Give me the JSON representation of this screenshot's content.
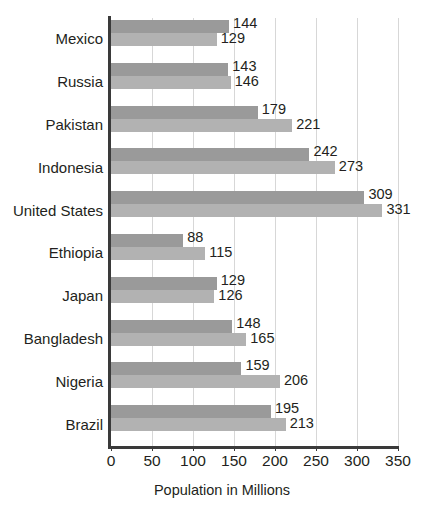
{
  "chart_data": {
    "type": "bar",
    "orientation": "horizontal",
    "title": "",
    "xlabel": "Population in Millions",
    "ylabel": "",
    "xlim": [
      0,
      350
    ],
    "xticks": [
      0,
      50,
      100,
      150,
      200,
      250,
      300,
      350
    ],
    "xtick_labels": [
      "0",
      "50",
      "100",
      "150",
      "200",
      "250",
      "300",
      "350"
    ],
    "grid": "vertical",
    "legend": "none",
    "categories": [
      "Mexico",
      "Russia",
      "Pakistan",
      "Indonesia",
      "United States",
      "Ethiopia",
      "Japan",
      "Bangladesh",
      "Nigeria",
      "Brazil"
    ],
    "series": [
      {
        "name": "series-1",
        "color": "#9a9a9a",
        "values": [
          144,
          143,
          179,
          242,
          309,
          88,
          129,
          148,
          159,
          195
        ]
      },
      {
        "name": "series-2",
        "color": "#b2b2b2",
        "values": [
          129,
          146,
          221,
          273,
          331,
          115,
          126,
          165,
          206,
          213
        ]
      }
    ],
    "data_labels": [
      [
        "144",
        "129"
      ],
      [
        "143",
        "146"
      ],
      [
        "179",
        "221"
      ],
      [
        "242",
        "273"
      ],
      [
        "309",
        "331"
      ],
      [
        "88",
        "115"
      ],
      [
        "129",
        "126"
      ],
      [
        "148",
        "165"
      ],
      [
        "159",
        "206"
      ],
      [
        "195",
        "213"
      ]
    ],
    "colors": {
      "series_1": "#9a9a9a",
      "series_2": "#b2b2b2",
      "axis": "#3a3a3a",
      "gridline": "#d7d7d7",
      "text": "#231f20",
      "background": "#ffffff"
    }
  }
}
